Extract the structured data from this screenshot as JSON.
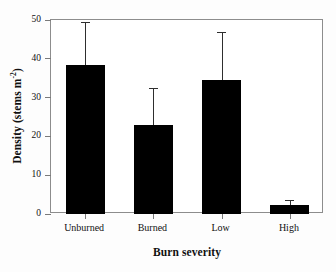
{
  "chart_data": {
    "type": "bar",
    "title": "",
    "subtitle": "",
    "xlabel": "Burn severity",
    "ylabel": "Density (stems m",
    "ylabel_sup": "-2",
    "ylabel_tail": ")",
    "ylabel_full": "Density (stems m-2)",
    "categories": [
      "Unburned",
      "Burned",
      "Low",
      "High"
    ],
    "values": [
      38.5,
      22.9,
      34.6,
      2.3
    ],
    "error_upper": [
      49.4,
      32.6,
      47.0,
      3.5
    ],
    "error_plus": [
      10.9,
      9.7,
      12.4,
      1.2
    ],
    "ylim": [
      0,
      50
    ],
    "yticks": [
      0,
      10,
      20,
      30,
      40,
      50
    ],
    "ytick_labels": [
      "0",
      "10",
      "20",
      "30",
      "40",
      "50"
    ],
    "grid": false,
    "legend": "none",
    "bar_color": "#000000",
    "error_color": "#2e2e2e",
    "frame_color": "#8d8d8d",
    "background": "#ffffff"
  }
}
